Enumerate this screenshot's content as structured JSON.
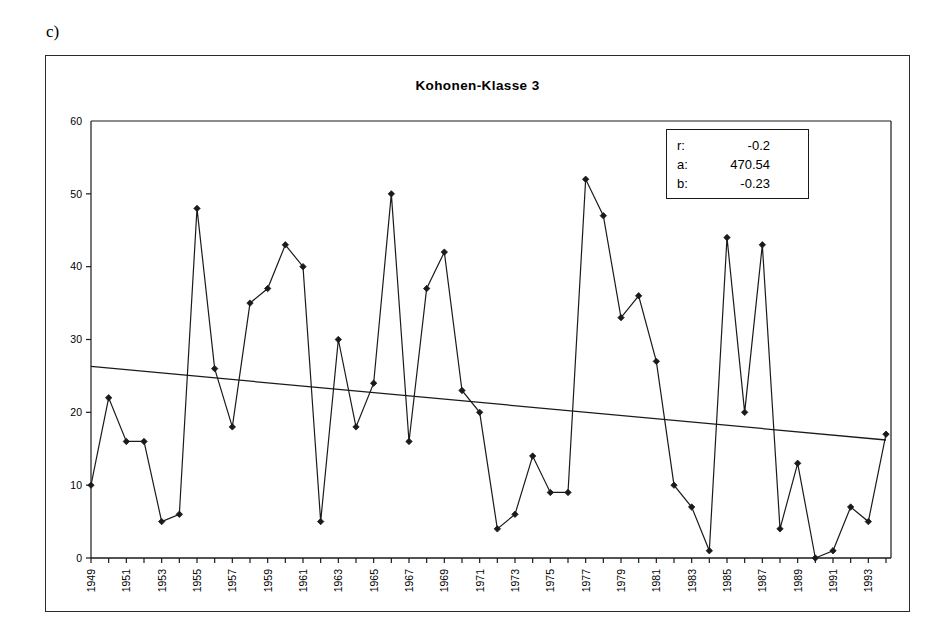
{
  "panel": {
    "letter": "c)"
  },
  "chart_data": {
    "type": "line",
    "title": "Kohonen-Klasse 3",
    "xlabel": "",
    "ylabel": "",
    "xlim": [
      1949,
      1994
    ],
    "ylim": [
      0,
      60
    ],
    "yticks": [
      0,
      10,
      20,
      30,
      40,
      50,
      60
    ],
    "grid": false,
    "legend_position": "inside-top-right",
    "marker": "diamond",
    "series": [
      {
        "name": "Kohonen-Klasse 3",
        "type": "line-markers",
        "x": [
          1949,
          1950,
          1951,
          1952,
          1953,
          1954,
          1955,
          1956,
          1957,
          1958,
          1959,
          1960,
          1961,
          1962,
          1963,
          1964,
          1965,
          1966,
          1967,
          1968,
          1969,
          1970,
          1971,
          1972,
          1973,
          1974,
          1975,
          1976,
          1977,
          1978,
          1979,
          1980,
          1981,
          1982,
          1983,
          1984,
          1985,
          1986,
          1987,
          1988,
          1989,
          1990,
          1991,
          1992,
          1993,
          1994
        ],
        "values": [
          10,
          22,
          16,
          16,
          5,
          6,
          48,
          26,
          18,
          35,
          37,
          43,
          40,
          5,
          30,
          18,
          24,
          50,
          16,
          37,
          42,
          23,
          20,
          4,
          6,
          14,
          9,
          9,
          52,
          47,
          33,
          36,
          27,
          10,
          7,
          1,
          44,
          20,
          43,
          4,
          13,
          0,
          1,
          7,
          5,
          17
        ]
      },
      {
        "name": "Trendlinie",
        "type": "line",
        "x": [
          1949,
          1994
        ],
        "values": [
          26.3,
          16.2
        ]
      }
    ],
    "xticklabels": [
      "1949",
      "1951",
      "1953",
      "1955",
      "1957",
      "1959",
      "1961",
      "1963",
      "1965",
      "1967",
      "1969",
      "1971",
      "1973",
      "1975",
      "1977",
      "1979",
      "1981",
      "1983",
      "1985",
      "1987",
      "1989",
      "1991",
      "1993"
    ],
    "annotations": {
      "r_label": "r:",
      "r_value": "-0.2",
      "a_label": "a:",
      "a_value": "470.54",
      "b_label": "b:",
      "b_value": "-0.23"
    }
  },
  "colors": {
    "line": "#1a1a1a",
    "trend": "#1a1a1a",
    "axis": "#1a1a1a",
    "frame": "#2b2b2b",
    "background": "#ffffff"
  }
}
